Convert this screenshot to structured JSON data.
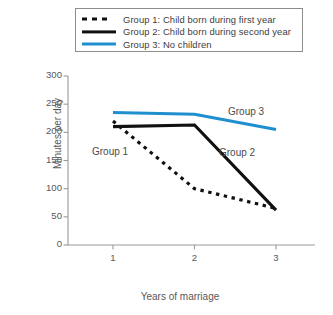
{
  "figure": {
    "background": "#ffffff"
  },
  "legend": {
    "position": "top",
    "border_color": "#8d8d8d",
    "entries": [
      {
        "label": "Group 1: Child born during first year",
        "style": "dotted",
        "color": "#111111",
        "swatch": "dotted-line-swatch"
      },
      {
        "label": "Group 2: Child born during second year",
        "style": "solid",
        "color": "#111111",
        "swatch": "solid-line-swatch"
      },
      {
        "label": "Group 3: No children",
        "style": "solid",
        "color": "#1f8fd0",
        "swatch": "blue-line-swatch"
      }
    ]
  },
  "annotations": [
    {
      "text": "Group 1",
      "x_px": 92,
      "y_px": 146
    },
    {
      "text": "Group 2",
      "x_px": 219,
      "y_px": 147
    },
    {
      "text": "Group 3",
      "x_px": 228,
      "y_px": 106
    }
  ],
  "chart_data": {
    "type": "line",
    "title": "",
    "xlabel": "Years of marriage",
    "ylabel": "Minutes per day",
    "x": [
      1,
      2,
      3
    ],
    "xtick_labels": [
      "1",
      "2",
      "3"
    ],
    "xlim": [
      0.55,
      3.45
    ],
    "ylim": [
      0,
      300
    ],
    "ytick_labels": [
      "0",
      "50",
      "100",
      "150",
      "200",
      "250",
      "300"
    ],
    "yticks": [
      0,
      50,
      100,
      150,
      200,
      250,
      300
    ],
    "grid": false,
    "legend_position": "top",
    "series": [
      {
        "name": "Group 1: Child born during first year",
        "short_name": "Group 1",
        "values": [
          220,
          100,
          65
        ],
        "color": "#111111",
        "style": "dotted",
        "width": 3.2
      },
      {
        "name": "Group 2: Child born during second year",
        "short_name": "Group 2",
        "values": [
          210,
          213,
          62
        ],
        "color": "#111111",
        "style": "solid",
        "width": 3.2
      },
      {
        "name": "Group 3: No children",
        "short_name": "Group 3",
        "values": [
          235,
          232,
          205
        ],
        "color": "#1f8fd0",
        "style": "solid",
        "width": 3.0
      }
    ]
  }
}
